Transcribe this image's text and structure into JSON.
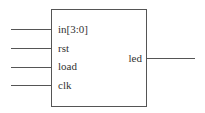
{
  "diagram": {
    "type": "block-symbol",
    "inputs": [
      {
        "label": "in[3:0]"
      },
      {
        "label": "rst"
      },
      {
        "label": "load"
      },
      {
        "label": "clk"
      }
    ],
    "outputs": [
      {
        "label": "led"
      }
    ],
    "colors": {
      "line": "#555555",
      "text": "#333333",
      "background": "#ffffff"
    }
  }
}
